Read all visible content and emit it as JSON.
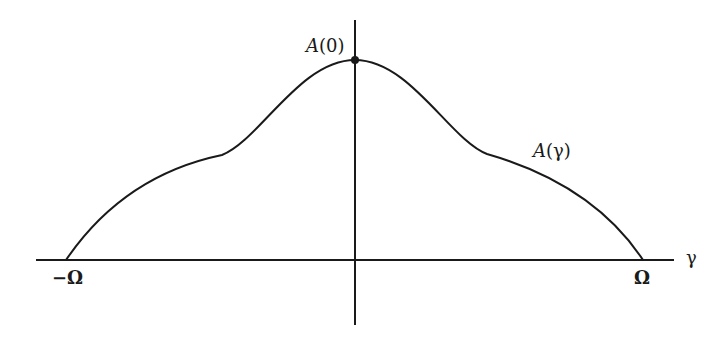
{
  "figure": {
    "peak_label": "A(0)",
    "curve_label": "A(γ)",
    "x_axis_label": "γ",
    "left_bound_label": "−Ω",
    "right_bound_label": "Ω"
  },
  "colors": {
    "stroke": "#1a1a1a",
    "background": "#ffffff"
  }
}
